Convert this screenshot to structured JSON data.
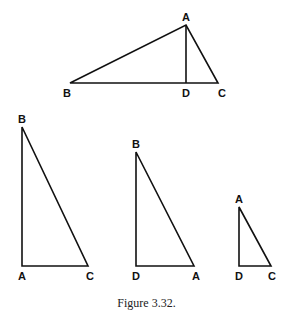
{
  "figure": {
    "caption": "Figure 3.32.",
    "stroke_color": "#111111",
    "triangles": [
      {
        "name": "top-triangle-ABC",
        "points": {
          "A": [
            186,
            25
          ],
          "B": [
            70,
            83
          ],
          "C": [
            218,
            83
          ],
          "D": [
            186,
            83
          ]
        },
        "labels": {
          "A": "A",
          "B": "B",
          "C": "C",
          "D": "D"
        },
        "note": "altitude AD to base BC"
      },
      {
        "name": "triangle-BAC",
        "points": {
          "B": [
            22,
            127
          ],
          "A": [
            22,
            266
          ],
          "C": [
            88,
            266
          ]
        },
        "labels": {
          "B": "B",
          "A": "A",
          "C": "C"
        }
      },
      {
        "name": "triangle-BDA",
        "points": {
          "B": [
            136,
            152
          ],
          "D": [
            136,
            266
          ],
          "A": [
            194,
            266
          ]
        },
        "labels": {
          "B": "B",
          "D": "D",
          "A": "A"
        }
      },
      {
        "name": "triangle-ADC",
        "points": {
          "A": [
            239,
            207
          ],
          "D": [
            239,
            266
          ],
          "C": [
            271,
            266
          ]
        },
        "labels": {
          "A": "A",
          "D": "D",
          "C": "C"
        }
      }
    ]
  }
}
